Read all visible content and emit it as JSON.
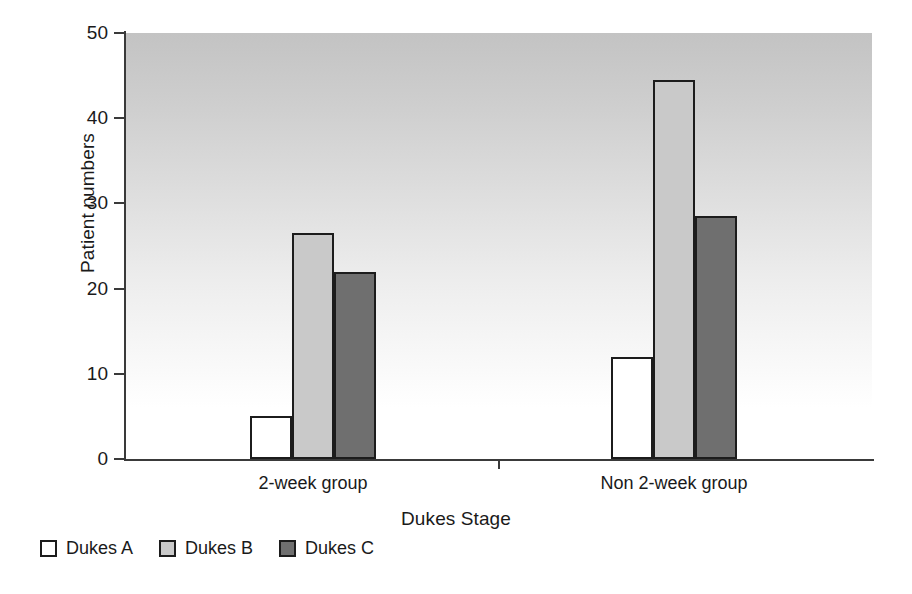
{
  "chart_data": {
    "type": "bar",
    "title": "",
    "xlabel": "Dukes Stage",
    "ylabel": "Patient numbers",
    "categories": [
      "2-week group",
      "Non 2-week group"
    ],
    "series": [
      {
        "name": "Dukes A",
        "values": [
          5,
          12
        ],
        "color": "#ffffff"
      },
      {
        "name": "Dukes B",
        "values": [
          26.5,
          44.5
        ],
        "color": "#c9c9c9"
      },
      {
        "name": "Dukes C",
        "values": [
          22,
          28.5
        ],
        "color": "#6f6f6f"
      }
    ],
    "ylim": [
      0,
      50
    ],
    "yticks": [
      0,
      10,
      20,
      30,
      40,
      50
    ],
    "ytick_labels": [
      "0",
      "10",
      "20",
      "30",
      "40",
      "50"
    ],
    "grid": false,
    "legend_position": "bottom-left",
    "plot_background": "vertical-gradient-gray-to-white",
    "bar_border_color": "#1c1c1c"
  },
  "axes": {
    "y_title": "Patient numbers",
    "x_title": "Dukes Stage"
  },
  "legend": {
    "items": [
      {
        "label": "Dukes A",
        "swatch": "s0"
      },
      {
        "label": "Dukes B",
        "swatch": "s1"
      },
      {
        "label": "Dukes C",
        "swatch": "s2"
      }
    ]
  }
}
